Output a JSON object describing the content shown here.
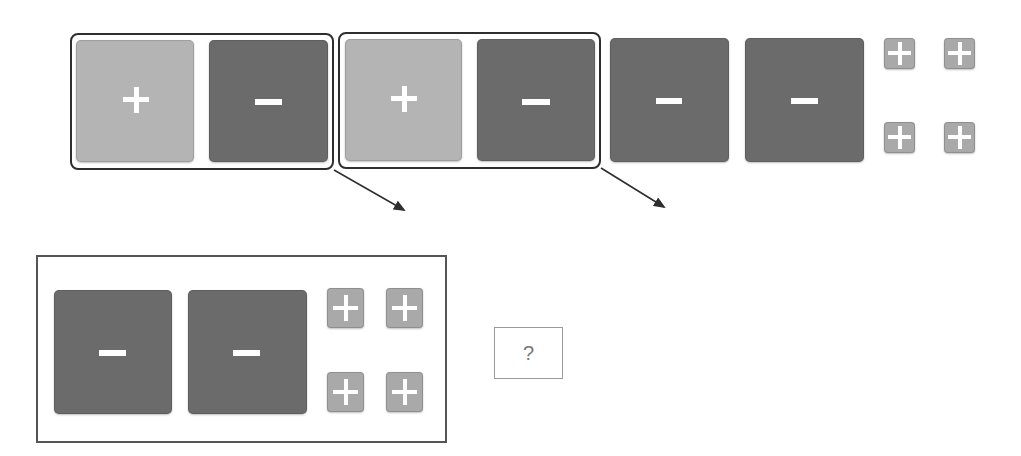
{
  "diagram": {
    "type": "integer tile model",
    "top_row": {
      "zero_pairs": [
        {
          "tiles": [
            {
              "sign": "+",
              "shade": "light"
            },
            {
              "sign": "−",
              "shade": "dark"
            }
          ]
        },
        {
          "tiles": [
            {
              "sign": "+",
              "shade": "light"
            },
            {
              "sign": "−",
              "shade": "dark"
            }
          ]
        }
      ],
      "remaining_large_tiles": [
        {
          "sign": "−",
          "shade": "dark"
        },
        {
          "sign": "−",
          "shade": "dark"
        }
      ],
      "small_unit_tiles": [
        "+",
        "+",
        "+",
        "+"
      ]
    },
    "arrows": 2,
    "result": {
      "large_tiles": [
        "−",
        "−"
      ],
      "small_unit_tiles": [
        "+",
        "+",
        "+",
        "+"
      ]
    },
    "answer_box": {
      "label": "?"
    }
  },
  "colors": {
    "light_tile": "#b4b4b4",
    "dark_tile": "#6b6b6b",
    "small_tile": "#a9a9a9",
    "outline": "#2e2e2e"
  }
}
